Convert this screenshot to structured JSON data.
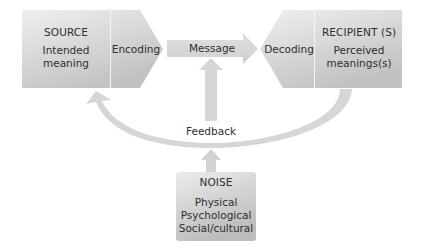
{
  "source": {
    "title": "SOURCE",
    "lines": [
      "Intended",
      "meaning"
    ]
  },
  "encoding": {
    "label": "Encoding"
  },
  "message": {
    "label": "Message"
  },
  "decoding": {
    "label": "Decoding"
  },
  "recipient": {
    "title": "RECIPIENT (S)",
    "lines": [
      "Perceived",
      "meanings(s)"
    ]
  },
  "feedback": {
    "label": "Feedback"
  },
  "noise": {
    "title": "NOISE",
    "lines": [
      "Physical",
      "Psychological",
      "Social/cultural"
    ]
  },
  "colors": {
    "box_light": "#ececec",
    "box_dark": "#bdbdbd",
    "arrow": "#d4d4d4",
    "text": "#2e2e2e",
    "divider": "#f4f4f4"
  }
}
